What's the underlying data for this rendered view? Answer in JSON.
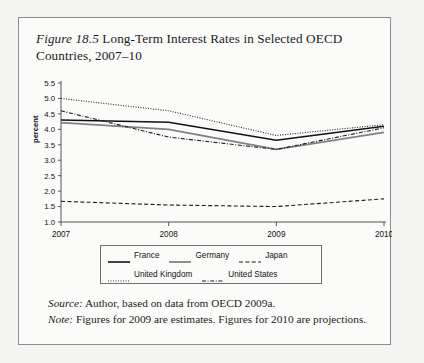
{
  "figure": {
    "number": "Figure 18.5",
    "title": " Long-Term Interest Rates in Selected OECD Countries, 2007–10"
  },
  "axis": {
    "ylabel": "percent",
    "yticks": [
      "1.0",
      "1.5",
      "2.0",
      "2.5",
      "3.0",
      "3.5",
      "4.0",
      "4.5",
      "5.0",
      "5.5"
    ],
    "xticks": [
      "2007",
      "2008",
      "2009",
      "2010"
    ]
  },
  "legend": {
    "row1": [
      {
        "label": "France",
        "style": "solid-black"
      },
      {
        "label": "Germany",
        "style": "solid-gray"
      },
      {
        "label": "Japan",
        "style": "dashed"
      }
    ],
    "row2": [
      {
        "label": "United Kingdom",
        "style": "dotted"
      },
      {
        "label": "United States",
        "style": "dash-dot"
      }
    ]
  },
  "footer": {
    "source_label": "Source:",
    "source_text": " Author, based on data from OECD 2009a.",
    "note_label": "Note:",
    "note_text": " Figures for 2009 are estimates. Figures for 2010 are projections."
  },
  "colors": {
    "france": "#111111",
    "germany": "#808080",
    "japan": "#1a1a1a",
    "united_kingdom": "#2a2a2a",
    "united_states": "#1a1a1a",
    "axis": "#555555",
    "frame": "#8d8d8d"
  },
  "chart_data": {
    "type": "line",
    "title": "Figure 18.5 Long-Term Interest Rates in Selected OECD Countries, 2007–10",
    "xlabel": "",
    "ylabel": "percent",
    "x": [
      2007,
      2008,
      2009,
      2010
    ],
    "categories": [
      "2007",
      "2008",
      "2009",
      "2010"
    ],
    "ylim": [
      1.0,
      5.5
    ],
    "ytick_step": 0.5,
    "grid": false,
    "legend_position": "bottom",
    "series": [
      {
        "name": "France",
        "style": "solid-black",
        "color": "#111111",
        "values": [
          4.3,
          4.23,
          3.65,
          4.1
        ]
      },
      {
        "name": "Germany",
        "style": "solid-gray",
        "color": "#808080",
        "values": [
          4.22,
          4.0,
          3.35,
          3.9
        ]
      },
      {
        "name": "Japan",
        "style": "dashed",
        "color": "#1a1a1a",
        "values": [
          1.67,
          1.55,
          1.5,
          1.75
        ]
      },
      {
        "name": "United Kingdom",
        "style": "dotted",
        "color": "#2a2a2a",
        "values": [
          5.0,
          4.6,
          3.8,
          4.15
        ]
      },
      {
        "name": "United States",
        "style": "dash-dot",
        "color": "#1a1a1a",
        "values": [
          4.6,
          3.75,
          3.35,
          4.05
        ]
      }
    ],
    "annotations": [
      "Figures for 2009 are estimates.",
      "Figures for 2010 are projections."
    ]
  }
}
